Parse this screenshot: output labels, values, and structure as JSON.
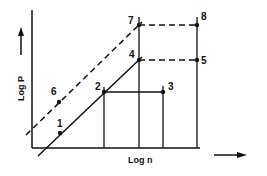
{
  "diagram": {
    "x_axis_label": "Log n",
    "y_axis_label": "Log P",
    "points": [
      {
        "id": "1",
        "label": "1",
        "x": 60,
        "y": 133
      },
      {
        "id": "2",
        "label": "2",
        "x": 104,
        "y": 92
      },
      {
        "id": "3",
        "label": "3",
        "x": 163,
        "y": 92
      },
      {
        "id": "4",
        "label": "4",
        "x": 139,
        "y": 60
      },
      {
        "id": "5",
        "label": "5",
        "x": 197,
        "y": 60
      },
      {
        "id": "6",
        "label": "6",
        "x": 59,
        "y": 102
      },
      {
        "id": "7",
        "label": "7",
        "x": 139,
        "y": 25
      },
      {
        "id": "8",
        "label": "8",
        "x": 197,
        "y": 25
      }
    ],
    "colors": {
      "line": "#111111",
      "background": "#ffffff"
    }
  }
}
